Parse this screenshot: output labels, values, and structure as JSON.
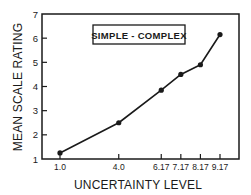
{
  "chart_data": {
    "type": "line",
    "title": "",
    "xlabel": "UNCERTAINTY LEVEL",
    "ylabel": "MEAN SCALE RATING",
    "legend": {
      "label": "SIMPLE - COMPLEX",
      "position": "top-center, boxed"
    },
    "x_tick_labels": [
      "1.0",
      "4.0",
      "6.17",
      "7.17",
      "8.17",
      "9.17"
    ],
    "x": [
      1.0,
      4.0,
      6.17,
      7.17,
      8.17,
      9.17
    ],
    "y_ticks": [
      1,
      2,
      3,
      4,
      5,
      6,
      7
    ],
    "ylim": [
      1,
      7
    ],
    "grid": false,
    "series": [
      {
        "name": "SIMPLE - COMPLEX",
        "marker": "filled-circle",
        "color": "#1a1a1a",
        "values": [
          1.25,
          2.5,
          3.85,
          4.5,
          4.9,
          6.15
        ]
      }
    ]
  },
  "colors": {
    "ink": "#1a1a1a",
    "background": "#ffffff"
  }
}
